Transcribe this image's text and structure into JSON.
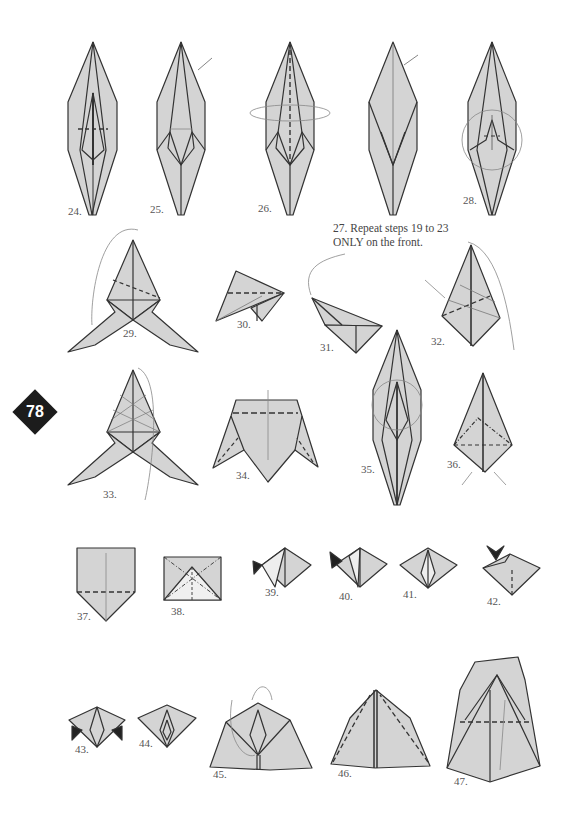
{
  "page": {
    "page_number": "78",
    "paper_color": "#d4d4d4",
    "line_color": "#333333",
    "badge_color": "#1c1c1c"
  },
  "steps": [
    {
      "number": "24.",
      "label": "24."
    },
    {
      "number": "25.",
      "label": "25."
    },
    {
      "number": "26.",
      "label": "26."
    },
    {
      "number": "27.",
      "label": "27. Repeat steps 19 to 23 ONLY on the front."
    },
    {
      "number": "28.",
      "label": "28."
    },
    {
      "number": "29.",
      "label": "29."
    },
    {
      "number": "30.",
      "label": "30."
    },
    {
      "number": "31.",
      "label": "31."
    },
    {
      "number": "32.",
      "label": "32."
    },
    {
      "number": "33.",
      "label": "33."
    },
    {
      "number": "34.",
      "label": "34."
    },
    {
      "number": "35.",
      "label": "35."
    },
    {
      "number": "36.",
      "label": "36."
    },
    {
      "number": "37.",
      "label": "37."
    },
    {
      "number": "38.",
      "label": "38."
    },
    {
      "number": "39.",
      "label": "39."
    },
    {
      "number": "40.",
      "label": "40."
    },
    {
      "number": "41.",
      "label": "41."
    },
    {
      "number": "42.",
      "label": "42."
    },
    {
      "number": "43.",
      "label": "43."
    },
    {
      "number": "44.",
      "label": "44."
    },
    {
      "number": "45.",
      "label": "45."
    },
    {
      "number": "46.",
      "label": "46."
    },
    {
      "number": "47.",
      "label": "47."
    }
  ],
  "note": {
    "line1": "27. Repeat steps 19 to 23",
    "line2": "ONLY on the front."
  }
}
